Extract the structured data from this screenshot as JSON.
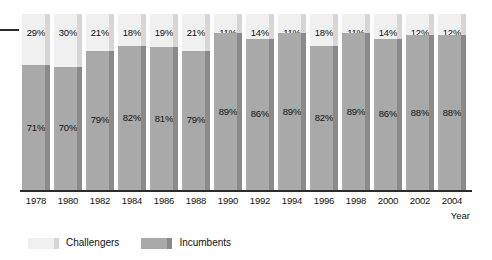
{
  "chart_data": {
    "type": "bar",
    "subtype": "100% stacked column",
    "title": "",
    "xlabel": "Year",
    "ylabel": "",
    "ylim": [
      0,
      100
    ],
    "grid": false,
    "legend_position": "bottom-left",
    "categories": [
      "1978",
      "1980",
      "1982",
      "1984",
      "1986",
      "1988",
      "1990",
      "1992",
      "1994",
      "1996",
      "1998",
      "2000",
      "2002",
      "2004"
    ],
    "series": [
      {
        "name": "Challengers",
        "color": "#f0f0f0",
        "values": [
          29,
          30,
          21,
          18,
          19,
          21,
          11,
          14,
          11,
          18,
          11,
          14,
          12,
          12
        ],
        "labels": [
          "29%",
          "30%",
          "21%",
          "18%",
          "19%",
          "21%",
          "11%",
          "14%",
          "11%",
          "18%",
          "11%",
          "14%",
          "12%",
          "12%"
        ]
      },
      {
        "name": "Incumbents",
        "color": "#a9a9a9",
        "values": [
          71,
          70,
          79,
          82,
          81,
          79,
          89,
          86,
          89,
          82,
          89,
          86,
          88,
          88
        ],
        "labels": [
          "71%",
          "70%",
          "79%",
          "82%",
          "81%",
          "79%",
          "89%",
          "86%",
          "89%",
          "82%",
          "89%",
          "86%",
          "88%",
          "88%"
        ]
      }
    ]
  },
  "legend": {
    "items": [
      {
        "label": "Challengers",
        "swatch_class": "challengers"
      },
      {
        "label": "Incumbents",
        "swatch_class": "incumbents"
      }
    ]
  },
  "axis": {
    "x_title": "Year"
  },
  "colors": {
    "challengers": "#f0f0f0",
    "incumbents": "#a9a9a9",
    "edge_dark": "#8a8a8a",
    "edge_light": "#d6d6d6",
    "axis": "#2b2b2b",
    "text": "#111111",
    "background": "#ffffff"
  }
}
